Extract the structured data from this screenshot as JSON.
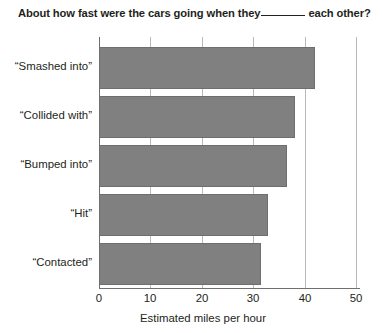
{
  "chart_data": {
    "type": "bar",
    "orientation": "horizontal",
    "title_parts": {
      "before_blank": "About how fast were the cars going when they",
      "blank": "______",
      "after_blank": "each other?"
    },
    "categories": [
      "“Smashed into”",
      "“Collided with”",
      "“Bumped into”",
      "“Hit”",
      "“Contacted”"
    ],
    "values": [
      42.1,
      38.2,
      36.5,
      32.8,
      31.6
    ],
    "xlabel": "Estimated miles per hour",
    "ylabel": "",
    "xlim": [
      0,
      50
    ],
    "xticks": [
      0,
      10,
      20,
      30,
      40,
      50
    ],
    "xtick_labels": [
      "0",
      "10",
      "20",
      "30",
      "40",
      "50"
    ],
    "grid": "vertical",
    "legend": null,
    "bar_color": "#808080",
    "grid_color": "#b9b9b9",
    "axis_color": "#6f6f6f",
    "text_color": "#231f20"
  }
}
